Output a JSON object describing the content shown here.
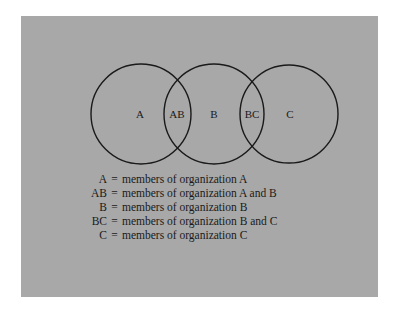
{
  "diagram": {
    "type": "venn",
    "background_color": "#a8a8a8",
    "stroke_color": "#1a1a1a",
    "circles": [
      {
        "id": "A",
        "cx": 141,
        "cy": 114,
        "r": 50
      },
      {
        "id": "B",
        "cx": 214,
        "cy": 114,
        "r": 50
      },
      {
        "id": "C",
        "cx": 289,
        "cy": 114,
        "r": 49
      }
    ],
    "region_labels": [
      {
        "text": "A",
        "x": 140,
        "y": 118
      },
      {
        "text": "AB",
        "x": 177,
        "y": 118
      },
      {
        "text": "B",
        "x": 214,
        "y": 118
      },
      {
        "text": "BC",
        "x": 252,
        "y": 118
      },
      {
        "text": "C",
        "x": 290,
        "y": 118
      }
    ]
  },
  "legend": {
    "rows": [
      {
        "key": "A",
        "eq": "=",
        "desc": "members of organization A"
      },
      {
        "key": "AB",
        "eq": "=",
        "desc": "members of organization A and B"
      },
      {
        "key": "B",
        "eq": "=",
        "desc": "members of organization B"
      },
      {
        "key": "BC",
        "eq": "=",
        "desc": "members of organization B and C"
      },
      {
        "key": "C",
        "eq": "=",
        "desc": "members of organization C"
      }
    ]
  }
}
